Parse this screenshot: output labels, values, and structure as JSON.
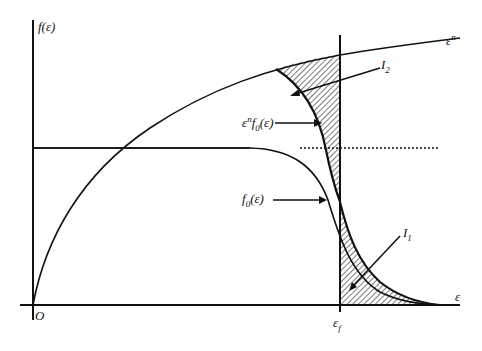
{
  "diagram": {
    "type": "Fermi-Dirac integral illustration",
    "labels": {
      "y_axis": "f(ε)",
      "x_axis": "ε",
      "origin": "O",
      "power_curve": "ε",
      "power_curve_exp": "n",
      "fermi_energy": "ε",
      "fermi_energy_sub": "f",
      "product_curve_base": "ε",
      "product_curve_sup": "n",
      "product_curve_rest": "f",
      "product_curve_sub": "0",
      "product_curve_arg": "(ε)",
      "fermi_curve_base": "f",
      "fermi_curve_sub": "0",
      "fermi_curve_arg": "(ε)",
      "region_upper": "I",
      "region_upper_sub": "2",
      "region_lower": "I",
      "region_lower_sub": "1"
    },
    "colors": {
      "line": "#111111",
      "background": "#ffffff",
      "hatch": "#222222"
    }
  }
}
